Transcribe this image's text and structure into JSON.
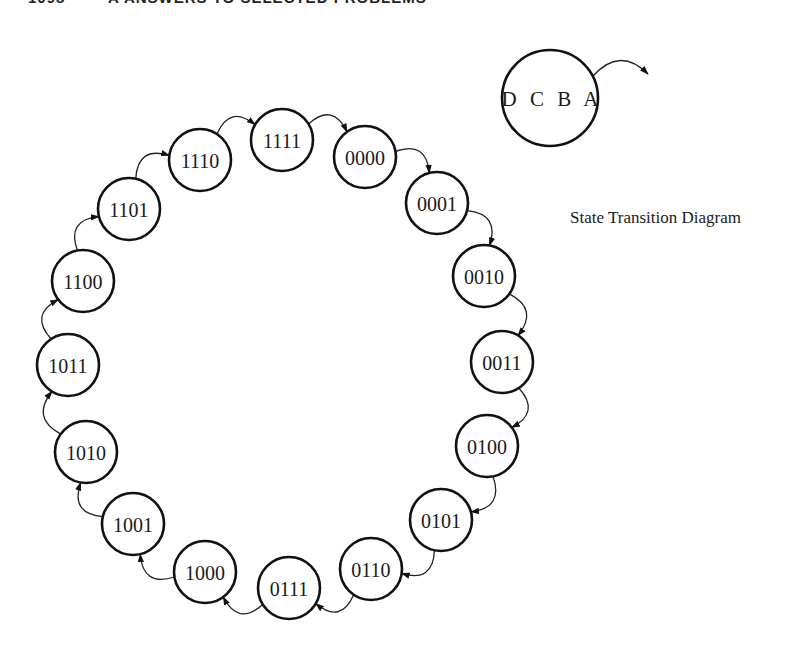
{
  "header": {
    "page_number": "1098",
    "title": "A ANSWERS TO SELECTED PROBLEMS"
  },
  "caption": "State Transition Diagram",
  "key": {
    "label": "D C B A",
    "cx": 550,
    "cy": 98,
    "r": 48
  },
  "colors": {
    "ink": "#111111",
    "background": "#ffffff"
  },
  "states": [
    {
      "label": "0000",
      "cx": 365,
      "cy": 157
    },
    {
      "label": "0001",
      "cx": 437,
      "cy": 203
    },
    {
      "label": "0010",
      "cx": 484,
      "cy": 276
    },
    {
      "label": "0011",
      "cx": 502,
      "cy": 362
    },
    {
      "label": "0100",
      "cx": 487,
      "cy": 446
    },
    {
      "label": "0101",
      "cx": 441,
      "cy": 520
    },
    {
      "label": "0110",
      "cx": 371,
      "cy": 569
    },
    {
      "label": "0111",
      "cx": 289,
      "cy": 588
    },
    {
      "label": "1000",
      "cx": 205,
      "cy": 572
    },
    {
      "label": "1001",
      "cx": 133,
      "cy": 524
    },
    {
      "label": "1010",
      "cx": 86,
      "cy": 452
    },
    {
      "label": "1011",
      "cx": 68,
      "cy": 365
    },
    {
      "label": "1100",
      "cx": 83,
      "cy": 281
    },
    {
      "label": "1101",
      "cx": 129,
      "cy": 209
    },
    {
      "label": "1110",
      "cx": 200,
      "cy": 160
    },
    {
      "label": "1111",
      "cx": 282,
      "cy": 140
    }
  ],
  "state_radius": 31,
  "transitions": [
    [
      "0000",
      "0001"
    ],
    [
      "0001",
      "0010"
    ],
    [
      "0010",
      "0011"
    ],
    [
      "0011",
      "0100"
    ],
    [
      "0100",
      "0101"
    ],
    [
      "0101",
      "0110"
    ],
    [
      "0110",
      "0111"
    ],
    [
      "0111",
      "1000"
    ],
    [
      "1000",
      "1001"
    ],
    [
      "1001",
      "1010"
    ],
    [
      "1010",
      "1011"
    ],
    [
      "1011",
      "1100"
    ],
    [
      "1100",
      "1101"
    ],
    [
      "1101",
      "1110"
    ],
    [
      "1110",
      "1111"
    ],
    [
      "1111",
      "0000"
    ]
  ]
}
